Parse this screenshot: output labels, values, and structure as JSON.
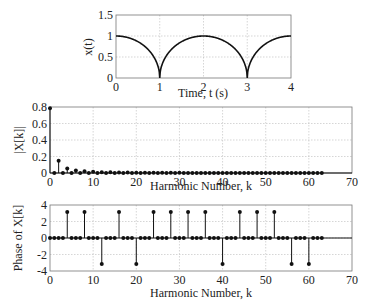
{
  "chart_data": [
    {
      "type": "line",
      "title": "",
      "xlabel": "Time, t (s)",
      "ylabel": "x(t)",
      "xlim": [
        0,
        4
      ],
      "ylim": [
        0,
        1.5
      ],
      "xticks": [
        0,
        1,
        2,
        3,
        4
      ],
      "yticks": [
        0,
        0.5,
        1,
        1.5
      ],
      "ytick_labels": [
        "0",
        "0.5",
        "1",
        "1.5"
      ],
      "grid": true,
      "description": "Periodic semicircle wave: x(t) = sqrt(1 - (t - 2m)^2), zeros at t=1 and t=3, peaks of 1 at t=0,2,4",
      "series": [
        {
          "name": "x(t)",
          "x": [
            0,
            0.25,
            0.5,
            0.75,
            0.9,
            1.0,
            1.1,
            1.25,
            1.5,
            1.75,
            2.0,
            2.25,
            2.5,
            2.75,
            2.9,
            3.0,
            3.1,
            3.25,
            3.5,
            3.75,
            4.0
          ],
          "values": [
            1,
            0.968,
            0.866,
            0.661,
            0.436,
            0,
            0.436,
            0.661,
            0.866,
            0.968,
            1,
            0.968,
            0.866,
            0.661,
            0.436,
            0,
            0.436,
            0.661,
            0.866,
            0.968,
            1
          ]
        }
      ]
    },
    {
      "type": "stem",
      "title": "",
      "xlabel": "Harmonic Number, k",
      "ylabel": "|X[k]|",
      "xlim": [
        0,
        70
      ],
      "ylim": [
        0,
        0.8
      ],
      "xticks": [
        0,
        10,
        20,
        30,
        40,
        50,
        60,
        70
      ],
      "yticks": [
        0,
        0.2,
        0.4,
        0.6,
        0.8
      ],
      "ytick_labels": [
        "0",
        "0.2",
        "0.4",
        "0.6",
        "0.8"
      ],
      "grid": true,
      "series": [
        {
          "name": "|X[k]|",
          "x": [
            0,
            1,
            2,
            3,
            4,
            5,
            6,
            7,
            8,
            9,
            10,
            11,
            12,
            13,
            14,
            15,
            16,
            17,
            18,
            19,
            20,
            21,
            22,
            23,
            24,
            25,
            26,
            27,
            28,
            29,
            30,
            31,
            32,
            33,
            34,
            35,
            36,
            37,
            38,
            39,
            40,
            41,
            42,
            43,
            44,
            45,
            46,
            47,
            48,
            49,
            50,
            51,
            52,
            53,
            54,
            55,
            56,
            57,
            58,
            59,
            60,
            61,
            62,
            63
          ],
          "values": [
            0.785,
            0,
            0.15,
            0,
            0.055,
            0,
            0.03,
            0,
            0.02,
            0,
            0.014,
            0,
            0.01,
            0,
            0.008,
            0,
            0.006,
            0,
            0.005,
            0,
            0.004,
            0,
            0.003,
            0,
            0.003,
            0,
            0.002,
            0,
            0.002,
            0,
            0.002,
            0,
            0.001,
            0,
            0.001,
            0,
            0.001,
            0,
            0.001,
            0,
            0.001,
            0,
            0.001,
            0,
            0.001,
            0,
            0.001,
            0,
            0.001,
            0,
            0.001,
            0,
            0.001,
            0,
            0.001,
            0,
            0.001,
            0,
            0.001,
            0,
            0.001,
            0,
            0.001,
            0
          ]
        }
      ]
    },
    {
      "type": "stem",
      "title": "",
      "xlabel": "Harmonic Number, k",
      "ylabel": "Phase of X[k]",
      "xlim": [
        0,
        70
      ],
      "ylim": [
        -4,
        4
      ],
      "xticks": [
        0,
        10,
        20,
        30,
        40,
        50,
        60,
        70
      ],
      "yticks": [
        -4,
        -2,
        0,
        2,
        4
      ],
      "ytick_labels": [
        "-4",
        "-2",
        "0",
        "2",
        "4"
      ],
      "grid": true,
      "series": [
        {
          "name": "Phase of X[k]",
          "x": [
            0,
            1,
            2,
            3,
            4,
            5,
            6,
            7,
            8,
            9,
            10,
            11,
            12,
            13,
            14,
            15,
            16,
            17,
            18,
            19,
            20,
            21,
            22,
            23,
            24,
            25,
            26,
            27,
            28,
            29,
            30,
            31,
            32,
            33,
            34,
            35,
            36,
            37,
            38,
            39,
            40,
            41,
            42,
            43,
            44,
            45,
            46,
            47,
            48,
            49,
            50,
            51,
            52,
            53,
            54,
            55,
            56,
            57,
            58,
            59,
            60,
            61,
            62,
            63
          ],
          "values": [
            0,
            0,
            0,
            0,
            3.14,
            0,
            0,
            0,
            3.14,
            0,
            0,
            0,
            -3.14,
            0,
            0,
            0,
            3.14,
            0,
            0,
            0,
            -3.14,
            0,
            0,
            0,
            3.14,
            0,
            0,
            0,
            3.14,
            0,
            0,
            0,
            3.14,
            0,
            0,
            0,
            3.14,
            0,
            0,
            0,
            -3.14,
            0,
            0,
            0,
            3.14,
            0,
            0,
            0,
            3.14,
            0,
            0,
            0,
            3.14,
            0,
            0,
            0,
            -3.14,
            0,
            0,
            0,
            -3.14,
            0,
            0,
            0
          ]
        }
      ]
    }
  ],
  "labels": {
    "p1_x": "Time, t (s)",
    "p1_y": "x(t)",
    "p2_x": "Harmonic Number, k",
    "p2_y": "|X[k]|",
    "p3_x": "Harmonic Number, k",
    "p3_y": "Phase of X[k]"
  },
  "colors": {
    "line": "#111111",
    "grid": "#bbbbbb",
    "frame": "#777777"
  }
}
